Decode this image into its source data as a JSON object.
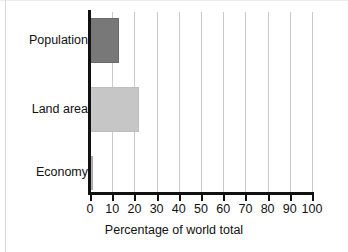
{
  "chart_data": {
    "type": "bar",
    "orientation": "horizontal",
    "title": "",
    "xlabel": "Percentage of world total",
    "ylabel": "",
    "categories": [
      "Population",
      "Land area",
      "Economy"
    ],
    "values": [
      13,
      22,
      1.5
    ],
    "series": [
      {
        "name": "Percentage of world total",
        "values": [
          13,
          22,
          1.5
        ]
      }
    ],
    "xlim": [
      0,
      100
    ],
    "xticks": [
      0,
      10,
      20,
      30,
      40,
      50,
      60,
      70,
      80,
      90,
      100
    ],
    "xtick_labels": [
      "0",
      "10",
      "20",
      "30",
      "40",
      "50",
      "60",
      "70",
      "80",
      "90",
      "100"
    ],
    "grid": "vertical",
    "legend": "none",
    "bar_colors": [
      "#787878",
      "#c6c6c6",
      "#b4b4b4"
    ],
    "gridline_color": "#c9c9c9",
    "axis_color": "#111111",
    "background_color": "#ffffff"
  },
  "axis": {
    "x_title": "Percentage of world total"
  }
}
